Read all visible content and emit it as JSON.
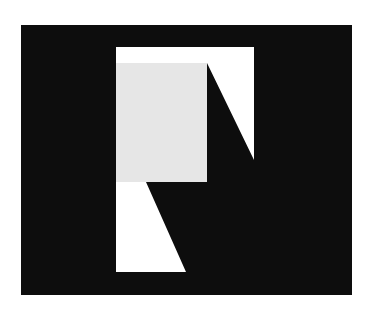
{
  "artwork": {
    "background_color": "#ffffff",
    "panel_color": "#0d0d0d",
    "white_shape_color": "#ffffff",
    "gray_block_color": "#e6e6e6"
  }
}
